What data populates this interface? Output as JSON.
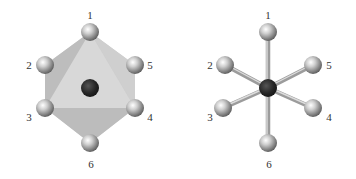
{
  "figure": {
    "left": {
      "title": "octahedron-polyhedral-view",
      "labels": {
        "a1": "1",
        "a2": "2",
        "a3": "3",
        "a4": "4",
        "a5": "5",
        "a6": "6"
      }
    },
    "right": {
      "title": "ball-and-stick-view",
      "labels": {
        "a1": "1",
        "a2": "2",
        "a3": "3",
        "a4": "4",
        "a5": "5",
        "a6": "6"
      }
    },
    "colors": {
      "face_light": "#d6d6d6",
      "face_mid": "#c4c4c4",
      "face_dark": "#b3b3b3",
      "ligand": "#9a9a9a",
      "center_atom": "#2a2a2a",
      "bond": "#a8a8a8"
    }
  }
}
